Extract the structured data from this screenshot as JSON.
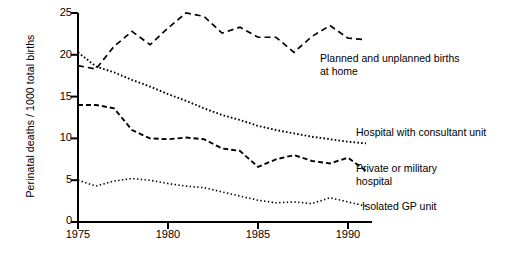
{
  "chart_data": {
    "type": "line",
    "title": "",
    "xlabel": "",
    "ylabel": "Perinatal deaths / 1000 total births",
    "xlim": [
      1975,
      1991
    ],
    "ylim": [
      0,
      25
    ],
    "grid": false,
    "legend_position": "inline-annotations",
    "xticks": [
      "1975",
      "1980",
      "1985",
      "1990"
    ],
    "xtick_values": [
      1975,
      1980,
      1985,
      1990
    ],
    "yticks": [
      "0",
      "5",
      "10",
      "15",
      "20",
      "25"
    ],
    "ytick_values": [
      0,
      5,
      10,
      15,
      20,
      25
    ],
    "x": [
      1975,
      1976,
      1977,
      1978,
      1979,
      1980,
      1981,
      1982,
      1983,
      1984,
      1985,
      1986,
      1987,
      1988,
      1989,
      1990,
      1991
    ],
    "series": [
      {
        "name": "Planned and unplanned births at home",
        "style": "long-dashed",
        "color": "#000000",
        "values": [
          18.7,
          18.3,
          21.0,
          22.8,
          21.2,
          23.2,
          25.0,
          24.6,
          22.6,
          23.3,
          22.1,
          22.1,
          20.3,
          22.2,
          23.5,
          22.0,
          21.8
        ]
      },
      {
        "name": "Hospital with consultant unit",
        "style": "dotted",
        "color": "#000000",
        "values": [
          20.3,
          18.6,
          17.9,
          17.0,
          16.2,
          15.3,
          14.5,
          13.6,
          12.8,
          12.2,
          11.5,
          11.0,
          10.6,
          10.2,
          9.9,
          9.6,
          9.4
        ]
      },
      {
        "name": "Private or military hospital",
        "style": "dashed",
        "color": "#000000",
        "values": [
          14.0,
          14.0,
          13.6,
          11.0,
          10.0,
          9.9,
          10.1,
          9.9,
          8.8,
          8.5,
          6.6,
          7.5,
          8.0,
          7.3,
          7.0,
          7.7,
          6.1
        ]
      },
      {
        "name": "Isolated GP unit",
        "style": "fine-dotted",
        "color": "#000000",
        "values": [
          5.0,
          4.3,
          4.9,
          5.2,
          5.0,
          4.6,
          4.3,
          4.1,
          3.6,
          3.1,
          2.6,
          2.3,
          2.4,
          2.2,
          2.9,
          2.4,
          1.9
        ]
      }
    ],
    "annotations": [
      {
        "id": "home",
        "text": "Planned and unplanned  births\nat home",
        "x": 320,
        "y": 59
      },
      {
        "id": "hospital",
        "text": "Hospital with consultant unit",
        "x": 358,
        "y": 132
      },
      {
        "id": "private",
        "text": "Private or military\nhospital",
        "x": 358,
        "y": 168
      },
      {
        "id": "gp",
        "text": "Isolated GP unit",
        "x": 364,
        "y": 207
      }
    ]
  },
  "axes": {
    "y_axis_title": "Perinatal deaths / 1000 total births"
  }
}
